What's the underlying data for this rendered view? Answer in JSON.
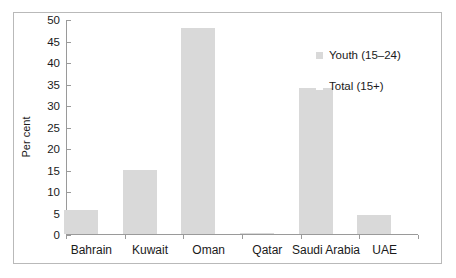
{
  "chart_data": {
    "type": "bar",
    "title": "",
    "subtitle": "",
    "xlabel": "",
    "ylabel": "Per cent",
    "ylim": [
      0,
      50
    ],
    "yticks": [
      0,
      5,
      10,
      15,
      20,
      25,
      30,
      35,
      40,
      45,
      50
    ],
    "grid": false,
    "legend_position": "upper-right-inside",
    "categories": [
      "Bahrain",
      "Kuwait",
      "Oman",
      "Qatar",
      "Saudi Arabia",
      "UAE"
    ],
    "series": [
      {
        "name": "Youth (15–24)",
        "color": "#d9d9d9",
        "values": [
          5.7,
          15.0,
          47.8,
          0.2,
          33.9,
          4.5
        ]
      },
      {
        "name": "Total (15+)",
        "color": "#ffffff",
        "values": [
          0,
          0,
          0,
          0,
          0,
          0
        ]
      }
    ]
  },
  "legend": {
    "items": [
      {
        "label": "Youth (15–24)"
      },
      {
        "label": "Total (15+)"
      }
    ]
  },
  "axes": {
    "y_title": "Per cent"
  }
}
